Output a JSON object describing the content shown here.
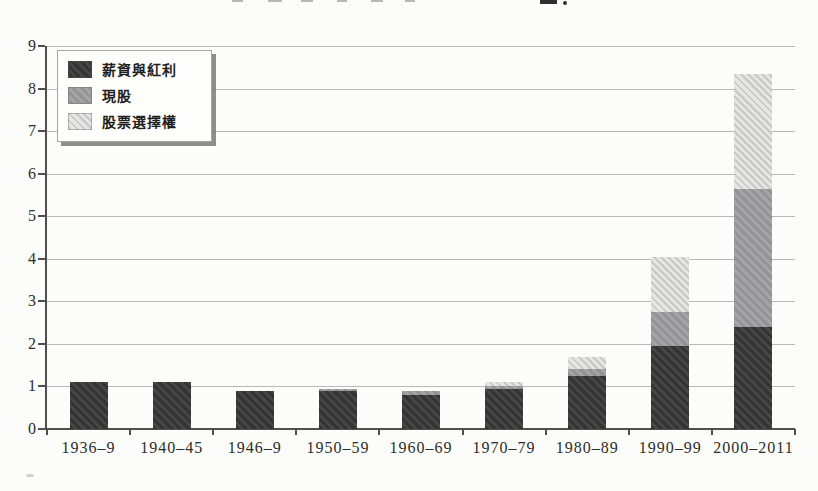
{
  "page": {
    "background": "#fcfcfa",
    "note_clipped_title": "chart title cropped at top edge of scan"
  },
  "chart_data": {
    "type": "bar",
    "stacked": true,
    "title": "",
    "xlabel": "",
    "ylabel": "",
    "categories": [
      "1936–9",
      "1940–45",
      "1946–9",
      "1950–59",
      "1960–69",
      "1970–79",
      "1980–89",
      "1990–99",
      "2000–2011"
    ],
    "series": [
      {
        "name": "薪資與紅利",
        "color_key": "salary",
        "color": "#3b3b3b",
        "values": [
          1.1,
          1.1,
          0.9,
          0.9,
          0.8,
          0.95,
          1.25,
          1.95,
          2.4
        ]
      },
      {
        "name": "現股",
        "color_key": "stock",
        "color": "#9b9b9b",
        "values": [
          0,
          0,
          0,
          0.05,
          0.1,
          0.05,
          0.15,
          0.8,
          3.25
        ]
      },
      {
        "name": "股票選擇權",
        "color_key": "options",
        "color": "#d7d7d5",
        "values": [
          0,
          0,
          0,
          0,
          0,
          0.1,
          0.3,
          1.3,
          2.7
        ]
      }
    ],
    "stack_totals": [
      1.1,
      1.1,
      0.9,
      0.95,
      0.9,
      1.1,
      1.7,
      4.05,
      8.35
    ],
    "ylim": [
      0,
      9
    ],
    "ytick_step": 1,
    "yticks": [
      "0",
      "1",
      "2",
      "3",
      "4",
      "5",
      "6",
      "7",
      "8",
      "9"
    ],
    "grid": true,
    "legend_position": "top-left",
    "colors": {
      "grid": "#b9b9b7",
      "axis": "#4f4f4d",
      "text": "#2d2d2b"
    }
  }
}
